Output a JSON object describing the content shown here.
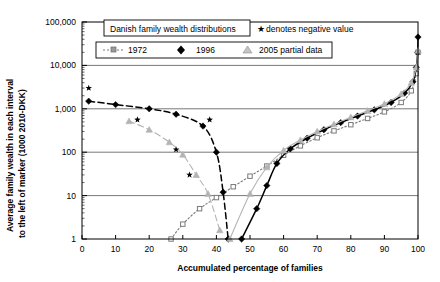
{
  "chart_data": {
    "type": "line",
    "title": "Danish family wealth distributions",
    "xlabel": "Accumulated percentage of families",
    "ylabel": "Average family wealth in each interval to the left of marker (1000 2010-DKK)",
    "yscale": "log",
    "ylim": [
      1,
      100000
    ],
    "xlim": [
      0,
      100
    ],
    "grid": true,
    "legend_position": "top-left-inside",
    "annotation": "★ denotes negative value",
    "yticks": [
      "1",
      "10",
      "100",
      "1,000",
      "10,000",
      "100,000"
    ],
    "ytick_values": [
      1,
      10,
      100,
      1000,
      10000,
      100000
    ],
    "xticks": [
      "0",
      "10",
      "20",
      "30",
      "40",
      "50",
      "60",
      "70",
      "80",
      "90",
      "100"
    ],
    "xtick_values": [
      0,
      10,
      20,
      30,
      40,
      50,
      60,
      70,
      80,
      90,
      100
    ],
    "series": [
      {
        "name": "1972",
        "marker": "square",
        "linestyle": "dotted",
        "color": "#7a7a7a",
        "negative_branch": {
          "x": [],
          "y": []
        },
        "points": [
          {
            "x": 26.5,
            "y": 1.0
          },
          {
            "x": 30.0,
            "y": 2.2
          },
          {
            "x": 35.0,
            "y": 5.0
          },
          {
            "x": 40.0,
            "y": 9.0
          },
          {
            "x": 45.0,
            "y": 16.0
          },
          {
            "x": 50.0,
            "y": 28.0
          },
          {
            "x": 55.0,
            "y": 48.0
          },
          {
            "x": 60.0,
            "y": 85.0
          },
          {
            "x": 65.0,
            "y": 140.0
          },
          {
            "x": 70.0,
            "y": 215.0
          },
          {
            "x": 75.0,
            "y": 310.0
          },
          {
            "x": 80.0,
            "y": 430.0
          },
          {
            "x": 85.0,
            "y": 600.0
          },
          {
            "x": 90.0,
            "y": 850.0
          },
          {
            "x": 95.0,
            "y": 1400.0
          },
          {
            "x": 98.0,
            "y": 2600.0
          },
          {
            "x": 99.5,
            "y": 6500.0
          },
          {
            "x": 100.0,
            "y": 20000.0
          }
        ]
      },
      {
        "name": "1996",
        "marker": "diamond",
        "linestyle": "dashed",
        "color": "#000000",
        "negative_branch": {
          "note": "values plotted as absolute magnitudes; starred points are negative",
          "points": [
            {
              "x": 2.0,
              "y": 1500.0,
              "negative": true
            },
            {
              "x": 10.0,
              "y": 1250.0,
              "negative": true
            },
            {
              "x": 20.0,
              "y": 1000.0,
              "negative": true
            },
            {
              "x": 28.0,
              "y": 750.0,
              "negative": true
            },
            {
              "x": 36.0,
              "y": 400.0,
              "negative": true
            },
            {
              "x": 40.0,
              "y": 100.0,
              "negative": true
            },
            {
              "x": 42.0,
              "y": 12.0,
              "negative": true
            },
            {
              "x": 43.5,
              "y": 1.0,
              "negative": true
            }
          ]
        },
        "points": [
          {
            "x": 47.5,
            "y": 1.0
          },
          {
            "x": 52.0,
            "y": 5.0
          },
          {
            "x": 55.0,
            "y": 17.0
          },
          {
            "x": 58.0,
            "y": 55.0
          },
          {
            "x": 62.0,
            "y": 120.0
          },
          {
            "x": 67.0,
            "y": 210.0
          },
          {
            "x": 72.0,
            "y": 330.0
          },
          {
            "x": 77.0,
            "y": 480.0
          },
          {
            "x": 82.0,
            "y": 680.0
          },
          {
            "x": 87.0,
            "y": 950.0
          },
          {
            "x": 92.0,
            "y": 1400.0
          },
          {
            "x": 96.0,
            "y": 2300.0
          },
          {
            "x": 98.5,
            "y": 4200.0
          },
          {
            "x": 99.5,
            "y": 9000.0
          },
          {
            "x": 99.9,
            "y": 20000.0
          },
          {
            "x": 100.0,
            "y": 45000.0
          }
        ]
      },
      {
        "name": "2005 partial data",
        "marker": "triangle",
        "linestyle": "dashed",
        "color": "#b4b4b4",
        "negative_branch": {
          "note": "values plotted as absolute magnitudes; starred points are negative",
          "points": [
            {
              "x": 14.0,
              "y": 520.0,
              "negative": true
            },
            {
              "x": 20.0,
              "y": 330.0,
              "negative": true
            },
            {
              "x": 26.0,
              "y": 170.0,
              "negative": true
            },
            {
              "x": 30.0,
              "y": 88.0,
              "negative": true
            },
            {
              "x": 34.0,
              "y": 30.0,
              "negative": true
            },
            {
              "x": 37.5,
              "y": 11.0,
              "negative": true
            },
            {
              "x": 41.0,
              "y": 1.6,
              "negative": true
            }
          ]
        },
        "points": [
          {
            "x": 44.0,
            "y": 1.0
          },
          {
            "x": 50.0,
            "y": 11.0
          },
          {
            "x": 55.0,
            "y": 45.0
          },
          {
            "x": 60.0,
            "y": 110.0
          },
          {
            "x": 65.0,
            "y": 190.0
          },
          {
            "x": 70.0,
            "y": 300.0
          },
          {
            "x": 75.0,
            "y": 440.0
          },
          {
            "x": 80.0,
            "y": 640.0
          },
          {
            "x": 85.0,
            "y": 900.0
          },
          {
            "x": 90.0,
            "y": 1300.0
          },
          {
            "x": 95.0,
            "y": 2200.0
          },
          {
            "x": 98.0,
            "y": 4000.0
          },
          {
            "x": 99.5,
            "y": 9000.0
          },
          {
            "x": 100.0,
            "y": 22000.0
          }
        ]
      }
    ],
    "negative_markers": [
      {
        "x": 2.0,
        "y": 3000.0
      },
      {
        "x": 38.0,
        "y": 560.0
      },
      {
        "x": 16.5,
        "y": 560.0
      },
      {
        "x": 28.0,
        "y": 115.0
      },
      {
        "x": 32.0,
        "y": 30.0
      }
    ]
  },
  "legend": {
    "title_box": "Danish family wealth distributions",
    "negative_note": "denotes negative value",
    "star_glyph": "★",
    "entries": [
      {
        "label": "1972",
        "marker": "square",
        "style": "dotted"
      },
      {
        "label": "1996",
        "marker": "diamond",
        "style": "solid"
      },
      {
        "label": "2005 partial data",
        "marker": "triangle",
        "style": "solid"
      }
    ]
  },
  "axes": {
    "y_title": "Average family wealth in each interval\nto the left of marker (1000 2010-DKK)",
    "y_title_line1": "Average family wealth in each interval",
    "y_title_line2": "to the left of marker (1000 2010-DKK)",
    "x_title": "Accumulated percentage of families"
  }
}
